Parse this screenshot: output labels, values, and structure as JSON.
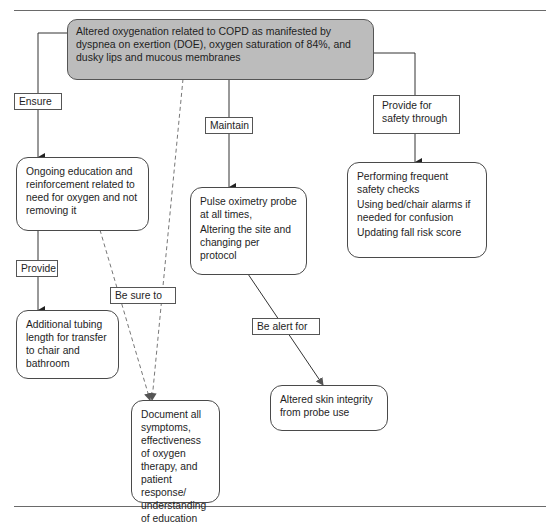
{
  "diagram": {
    "root": {
      "text": "Altered oxygenation related to COPD as manifested by dyspnea on exertion (DOE), oxygen saturation of 84%, and dusky lips and mucous membranes",
      "fill": "#bcbcbc"
    },
    "edge_labels": {
      "ensure": "Ensure",
      "provide": "Provide",
      "be_sure_to": "Be sure to",
      "maintain": "Maintain",
      "be_alert_for": "Be alert for",
      "provide_safety": "Provide for safety through"
    },
    "nodes": {
      "education": "Ongoing education and reinforcement related to need for oxygen and not removing it",
      "tubing": "Additional tubing length for transfer to chair and bathroom",
      "document": "Document all symptoms, effectiveness of oxygen therapy, and patient response/ understanding of education",
      "pulse_ox": {
        "line1": "Pulse oximetry probe at all times,",
        "line2": "Altering the site and changing per protocol"
      },
      "skin": "Altered skin integrity from probe use",
      "safety": {
        "item1": "Performing frequent safety checks",
        "item2": "Using bed/chair alarms if needed for confusion",
        "item3": "Updating fall risk score"
      }
    },
    "edges": [
      {
        "from": "root",
        "to": "education",
        "label": "Ensure",
        "style": "solid"
      },
      {
        "from": "education",
        "to": "tubing",
        "label": "Provide",
        "style": "solid"
      },
      {
        "from": "root",
        "to": "document",
        "label": "Be sure to",
        "style": "dashed"
      },
      {
        "from": "education",
        "to": "document",
        "label": "Be sure to",
        "style": "dashed"
      },
      {
        "from": "root",
        "to": "pulse_ox",
        "label": "Maintain",
        "style": "solid"
      },
      {
        "from": "pulse_ox",
        "to": "skin",
        "label": "Be alert for",
        "style": "solid"
      },
      {
        "from": "root",
        "to": "safety",
        "label": "Provide for safety through",
        "style": "solid"
      }
    ]
  }
}
